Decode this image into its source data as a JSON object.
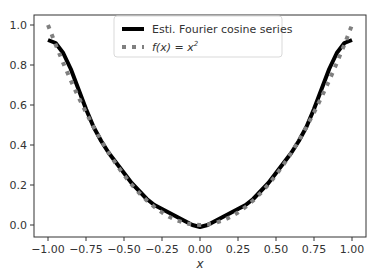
{
  "chart_data": {
    "type": "line",
    "title": "",
    "xlabel": "x",
    "ylabel": "",
    "xlim": [
      -1.1,
      1.1
    ],
    "ylim": [
      -0.06,
      1.05
    ],
    "grid": false,
    "legend_position": "upper center",
    "x_ticks": [
      "−1.00",
      "−0.75",
      "−0.50",
      "−0.25",
      "0.00",
      "0.25",
      "0.50",
      "0.75",
      "1.00"
    ],
    "x_tick_values": [
      -1.0,
      -0.75,
      -0.5,
      -0.25,
      0.0,
      0.25,
      0.5,
      0.75,
      1.0
    ],
    "y_ticks": [
      "0.0",
      "0.2",
      "0.4",
      "0.6",
      "0.8",
      "1.0"
    ],
    "y_tick_values": [
      0.0,
      0.2,
      0.4,
      0.6,
      0.8,
      1.0
    ],
    "x": [
      -1.0,
      -0.95,
      -0.9,
      -0.85,
      -0.8,
      -0.75,
      -0.7,
      -0.65,
      -0.6,
      -0.55,
      -0.5,
      -0.45,
      -0.4,
      -0.35,
      -0.3,
      -0.25,
      -0.2,
      -0.15,
      -0.1,
      -0.05,
      0.0,
      0.05,
      0.1,
      0.15,
      0.2,
      0.25,
      0.3,
      0.35,
      0.4,
      0.45,
      0.5,
      0.55,
      0.6,
      0.65,
      0.7,
      0.75,
      0.8,
      0.85,
      0.9,
      0.95,
      1.0
    ],
    "series": [
      {
        "name": "Esti. Fourier cosine series",
        "style": "solid",
        "color": "#000000",
        "values": [
          0.925,
          0.91,
          0.86,
          0.78,
          0.68,
          0.58,
          0.49,
          0.42,
          0.36,
          0.31,
          0.26,
          0.21,
          0.17,
          0.13,
          0.1,
          0.08,
          0.06,
          0.04,
          0.02,
          0.0,
          -0.01,
          0.0,
          0.02,
          0.04,
          0.06,
          0.08,
          0.1,
          0.13,
          0.17,
          0.21,
          0.26,
          0.31,
          0.36,
          0.42,
          0.49,
          0.58,
          0.68,
          0.78,
          0.86,
          0.91,
          0.925
        ]
      },
      {
        "name": "f(x) = x²",
        "style": "dotted",
        "color": "#808080",
        "values": [
          1.0,
          0.9025,
          0.81,
          0.7225,
          0.64,
          0.5625,
          0.49,
          0.4225,
          0.36,
          0.3025,
          0.25,
          0.2025,
          0.16,
          0.1225,
          0.09,
          0.0625,
          0.04,
          0.0225,
          0.01,
          0.0025,
          0.0,
          0.0025,
          0.01,
          0.0225,
          0.04,
          0.0625,
          0.09,
          0.1225,
          0.16,
          0.2025,
          0.25,
          0.3025,
          0.36,
          0.4225,
          0.49,
          0.5625,
          0.64,
          0.7225,
          0.81,
          0.9025,
          1.0
        ]
      }
    ]
  },
  "legend": {
    "items": [
      {
        "label": "Esti. Fourier cosine series",
        "style": "solid"
      },
      {
        "label_prefix": "f(x) = x",
        "label_sup": "2",
        "style": "dotted"
      }
    ]
  },
  "axes": {
    "xlabel": "x"
  }
}
